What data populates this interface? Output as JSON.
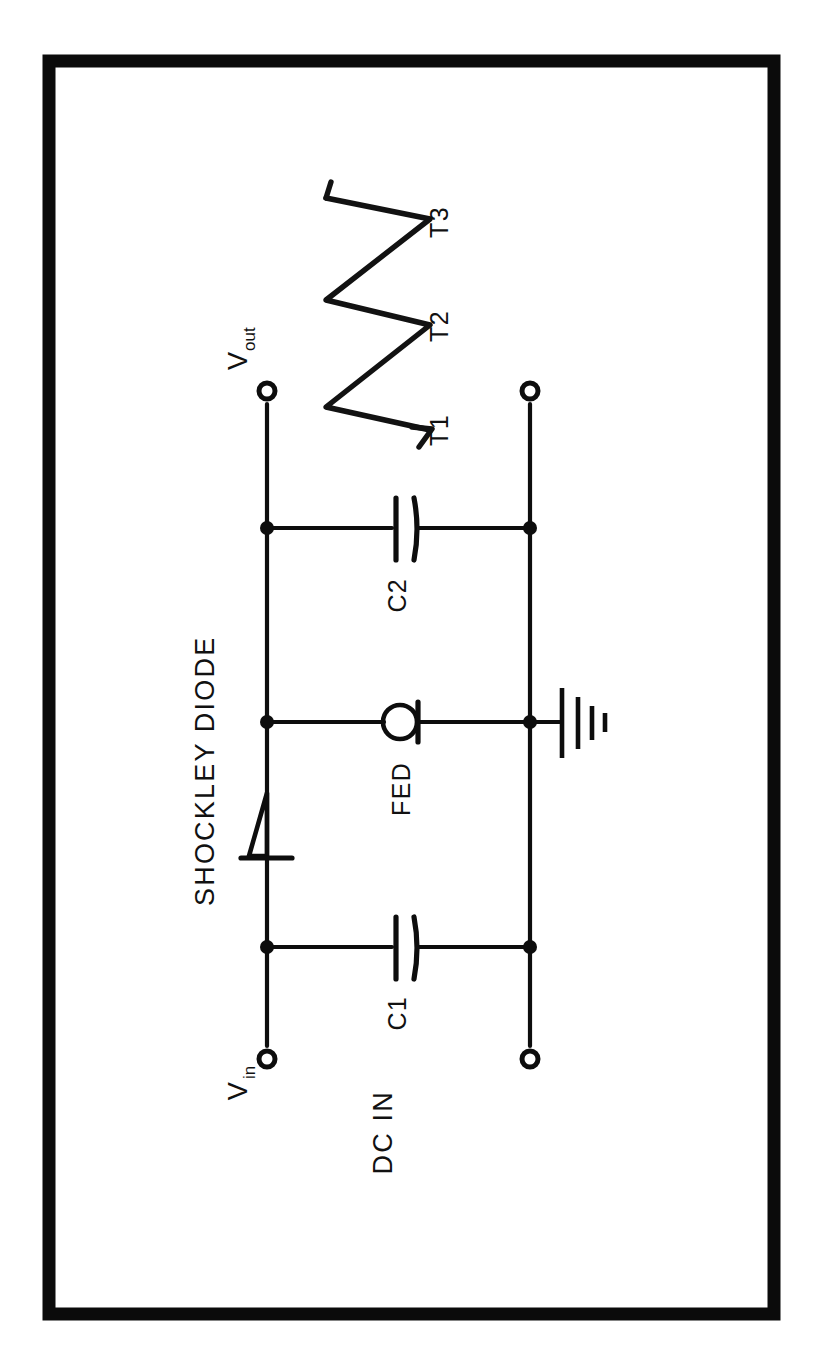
{
  "figure": {
    "kind": "schematic-circuit-diagram",
    "orientation_note": "rotated-90-ccw",
    "background_color": "#ffffff",
    "ink_color": "#0d0d0d",
    "border": {
      "visible": true,
      "color": "#0b0b0b"
    }
  },
  "labels": {
    "v_in": "V",
    "v_in_sub": "in",
    "v_out": "V",
    "v_out_sub": "out",
    "dc_in": "DC  IN",
    "shockley_diode": "SHOCKLEY DIODE",
    "fed": "FED",
    "c1": "C1",
    "c2": "C2",
    "t1": "T1",
    "t2": "T2",
    "t3": "T3"
  },
  "components": [
    {
      "id": "c1",
      "type": "capacitor",
      "label": "C1"
    },
    {
      "id": "c2",
      "type": "capacitor",
      "label": "C2"
    },
    {
      "id": "fed",
      "type": "field-emission-device",
      "label": "FED"
    },
    {
      "id": "shockley",
      "type": "shockley-diode",
      "label": "SHOCKLEY DIODE"
    },
    {
      "id": "gnd",
      "type": "ground",
      "label": ""
    }
  ],
  "terminals": [
    {
      "id": "vin",
      "label": "V",
      "sublabel": "in"
    },
    {
      "id": "vout",
      "label": "V",
      "sublabel": "out"
    },
    {
      "id": "dc-in-return",
      "label": ""
    },
    {
      "id": "out-return",
      "label": ""
    }
  ],
  "waveform": {
    "name": "sawtooth-output",
    "description": "relaxation-oscillator sawtooth at Vout",
    "period_markers": [
      "T1",
      "T2",
      "T3"
    ],
    "cycles": 3
  }
}
